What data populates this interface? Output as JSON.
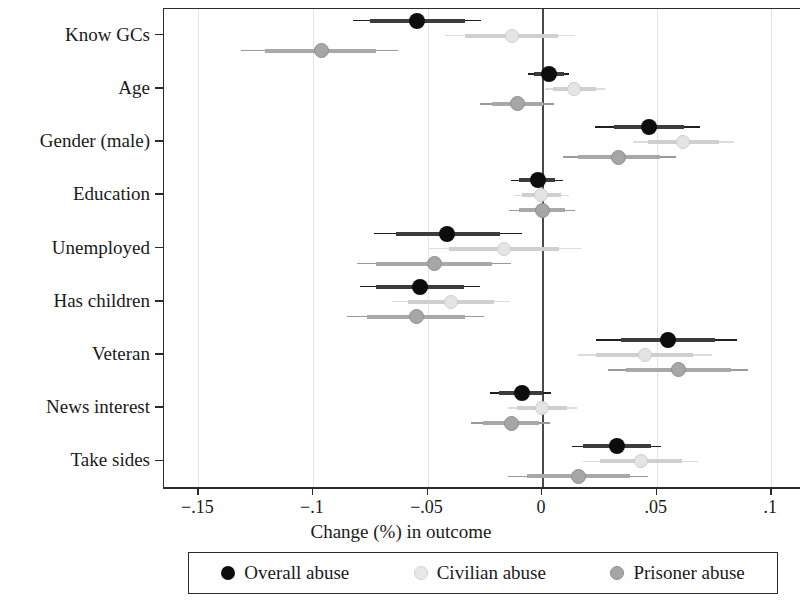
{
  "chart_data": {
    "type": "scatter",
    "title": "",
    "xlabel": "Change (%) in outcome",
    "ylabel": "",
    "xlim": [
      -0.165,
      0.113
    ],
    "xticks": [
      -0.15,
      -0.1,
      -0.05,
      0,
      0.05,
      0.1
    ],
    "xticklabels": [
      "−.15",
      "−.1",
      "−.05",
      "0",
      ".05",
      ".1"
    ],
    "grid": "vertical-light",
    "zero_reference_line": 0,
    "legend_position": "below-plot",
    "categories": [
      "Know GCs",
      "Age",
      "Gender (male)",
      "Education",
      "Unemployed",
      "Has children",
      "Veteran",
      "News interest",
      "Take sides"
    ],
    "series": [
      {
        "name": "Overall abuse",
        "color": "#0d0d0d",
        "values": [
          -0.054,
          0.0035,
          0.047,
          -0.0015,
          -0.041,
          -0.053,
          0.0555,
          -0.0085,
          0.033
        ],
        "ci_inner": [
          [
            -0.0745,
            -0.033
          ],
          [
            -0.003,
            0.01
          ],
          [
            0.032,
            0.0625
          ],
          [
            -0.0095,
            0.006
          ],
          [
            -0.0635,
            -0.018
          ],
          [
            -0.072,
            -0.0335
          ],
          [
            0.035,
            0.076
          ],
          [
            -0.0185,
            0.001
          ],
          [
            0.0185,
            0.048
          ]
        ],
        "ci_outer": [
          [
            -0.082,
            -0.026
          ],
          [
            -0.0055,
            0.012
          ],
          [
            0.0235,
            0.0695
          ],
          [
            -0.013,
            0.0095
          ],
          [
            -0.073,
            -0.0085
          ],
          [
            -0.079,
            -0.0265
          ],
          [
            0.024,
            0.0855
          ],
          [
            -0.0225,
            0.0045
          ],
          [
            0.0135,
            0.0525
          ]
        ]
      },
      {
        "name": "Civilian abuse",
        "color": "#e4e4e4",
        "values": [
          -0.0125,
          0.0145,
          0.062,
          0.0,
          -0.016,
          -0.0395,
          0.0455,
          0.0005,
          0.0435
        ],
        "ci_inner": [
          [
            -0.033,
            0.0075
          ],
          [
            0.005,
            0.024
          ],
          [
            0.0465,
            0.0775
          ],
          [
            -0.0085,
            0.0085
          ],
          [
            -0.04,
            0.008
          ],
          [
            -0.058,
            -0.0205
          ],
          [
            0.024,
            0.0665
          ],
          [
            -0.0105,
            0.0115
          ],
          [
            0.0255,
            0.0615
          ]
        ],
        "ci_outer": [
          [
            -0.042,
            0.015
          ],
          [
            0.0015,
            0.028
          ],
          [
            0.04,
            0.084
          ],
          [
            -0.012,
            0.012
          ],
          [
            -0.049,
            0.0175
          ],
          [
            -0.065,
            -0.0135
          ],
          [
            0.016,
            0.0745
          ],
          [
            -0.0145,
            0.0155
          ],
          [
            0.0185,
            0.0685
          ]
        ]
      },
      {
        "name": "Prisoner abuse",
        "color": "#a6a6a6",
        "values": [
          -0.096,
          -0.0105,
          0.034,
          0.0005,
          -0.0465,
          -0.0545,
          0.06,
          -0.013,
          0.0165
        ],
        "ci_inner": [
          [
            -0.1205,
            -0.072
          ],
          [
            -0.0215,
            0.001
          ],
          [
            0.016,
            0.052
          ],
          [
            -0.0095,
            0.0105
          ],
          [
            -0.072,
            -0.0215
          ],
          [
            -0.076,
            -0.033
          ],
          [
            0.037,
            0.083
          ],
          [
            -0.0255,
            -0.001
          ],
          [
            -0.006,
            0.039
          ]
        ],
        "ci_outer": [
          [
            -0.131,
            -0.0625
          ],
          [
            -0.0265,
            0.0055
          ],
          [
            0.0095,
            0.059
          ],
          [
            -0.014,
            0.015
          ],
          [
            -0.0805,
            -0.013
          ],
          [
            -0.0845,
            -0.025
          ],
          [
            0.029,
            0.0905
          ],
          [
            -0.0305,
            0.004
          ],
          [
            -0.0145,
            0.0465
          ]
        ]
      }
    ]
  },
  "legend": {
    "items": [
      {
        "label": "Overall abuse",
        "marker": "filled-circle-black"
      },
      {
        "label": "Civilian abuse",
        "marker": "filled-circle-light-gray"
      },
      {
        "label": "Prisoner abuse",
        "marker": "filled-circle-gray"
      }
    ]
  },
  "axis": {
    "x_title": "Change (%) in outcome"
  }
}
